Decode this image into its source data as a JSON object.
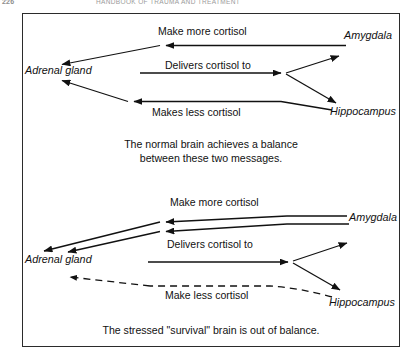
{
  "page": {
    "folio": "226",
    "running_title": "HANDBOOK OF TRAUMA AND TREATMENT"
  },
  "figure": {
    "border_color": "#2b2b2b",
    "background": "#ffffff",
    "panels": [
      {
        "id": "normal-brain",
        "caption_line_1": "The normal brain achieves a balance",
        "caption_line_2": "between these two messages.",
        "nodes": [
          {
            "id": "adrenal-gland",
            "label": "Adrenal gland"
          },
          {
            "id": "amygdala",
            "label": "Amygdala"
          },
          {
            "id": "hippocampus",
            "label": "Hippocampus"
          }
        ],
        "edges": [
          {
            "id": "make-more-cortisol",
            "label": "Make more cortisol",
            "from": "amygdala",
            "to": "adrenal-gland",
            "style": "solid"
          },
          {
            "id": "delivers-cortisol-to",
            "label": "Delivers cortisol to",
            "from": "adrenal-gland",
            "to": "brain",
            "style": "solid"
          },
          {
            "id": "makes-less-cortisol",
            "label": "Makes less cortisol",
            "from": "hippocampus",
            "to": "adrenal-gland",
            "style": "solid"
          }
        ]
      },
      {
        "id": "stressed-brain",
        "caption_line_1": "The stressed \"survival\" brain is out of balance.",
        "caption_line_2": "",
        "nodes": [
          {
            "id": "adrenal-gland",
            "label": "Adrenal gland"
          },
          {
            "id": "amygdala",
            "label": "Amygdala"
          },
          {
            "id": "hippocampus",
            "label": "Hippocampus"
          }
        ],
        "edges": [
          {
            "id": "make-more-cortisol",
            "label": "Make more cortisol",
            "from": "amygdala",
            "to": "adrenal-gland",
            "style": "double-solid"
          },
          {
            "id": "delivers-cortisol-to",
            "label": "Delivers cortisol to",
            "from": "adrenal-gland",
            "to": "brain",
            "style": "solid"
          },
          {
            "id": "make-less-cortisol",
            "label": "Make less cortisol",
            "from": "hippocampus",
            "to": "adrenal-gland",
            "style": "dashed"
          }
        ]
      }
    ]
  },
  "colors": {
    "ink": "#111111",
    "border": "#2b2b2b",
    "header_gray": "#9a9a9a"
  }
}
